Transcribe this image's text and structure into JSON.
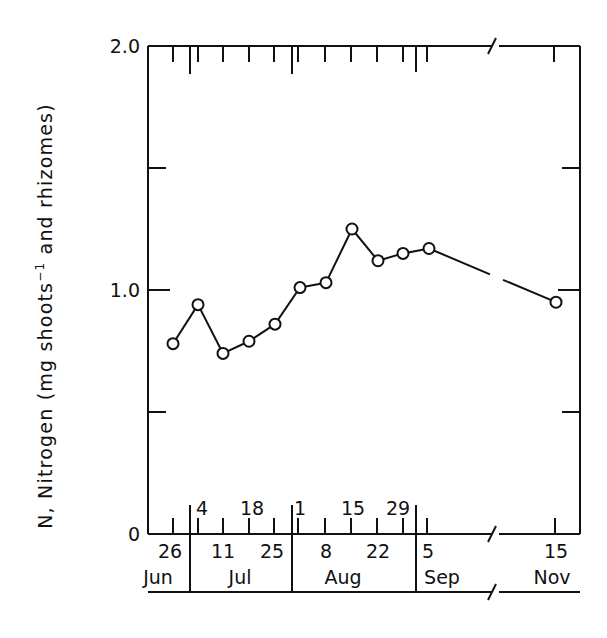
{
  "chart_data": {
    "type": "line",
    "title": "",
    "xlabel": "",
    "ylabel": "N, Nitrogen (mg shoots⁻¹ and rhizomes)",
    "ylabel_parts": {
      "main": "N, Nitrogen (mg shoots",
      "superscript": "−1",
      "rest": " and rhizomes)"
    },
    "ylim": [
      0,
      2.0
    ],
    "y_ticks": [
      {
        "value": 0,
        "label": "0"
      },
      {
        "value": 0.5,
        "label": ""
      },
      {
        "value": 1.0,
        "label": "1.0"
      },
      {
        "value": 1.5,
        "label": ""
      },
      {
        "value": 2.0,
        "label": "2.0"
      }
    ],
    "grid": false,
    "legend": null,
    "axis_break": "between 5 Sep and 15 Nov",
    "x": [
      "26 Jun",
      "4 Jul",
      "11 Jul",
      "18 Jul",
      "25 Jul",
      "1 Aug",
      "8 Aug",
      "15 Aug",
      "22 Aug",
      "29 Aug",
      "5 Sep",
      "15 Nov"
    ],
    "series": [
      {
        "name": "Nitrogen",
        "marker": "open-circle",
        "values": [
          0.78,
          0.94,
          0.74,
          0.79,
          0.86,
          1.01,
          1.03,
          1.25,
          1.12,
          1.15,
          1.17,
          0.95
        ]
      }
    ],
    "x_ticks_lower_row": [
      {
        "label": "26",
        "month": "Jun"
      },
      {
        "label": "11",
        "month": "Jul"
      },
      {
        "label": "25",
        "month": "Jul"
      },
      {
        "label": "8",
        "month": "Aug"
      },
      {
        "label": "22",
        "month": "Aug"
      },
      {
        "label": "5",
        "month": "Sep"
      },
      {
        "label": "15",
        "month": "Nov"
      }
    ],
    "x_ticks_upper_row": [
      {
        "label": "4",
        "month": "Jul"
      },
      {
        "label": "18",
        "month": "Jul"
      },
      {
        "label": "1",
        "month": "Aug"
      },
      {
        "label": "15",
        "month": "Aug"
      },
      {
        "label": "29",
        "month": "Aug"
      }
    ],
    "months": [
      "Jun",
      "Jul",
      "Aug",
      "Sep",
      "Nov"
    ]
  }
}
